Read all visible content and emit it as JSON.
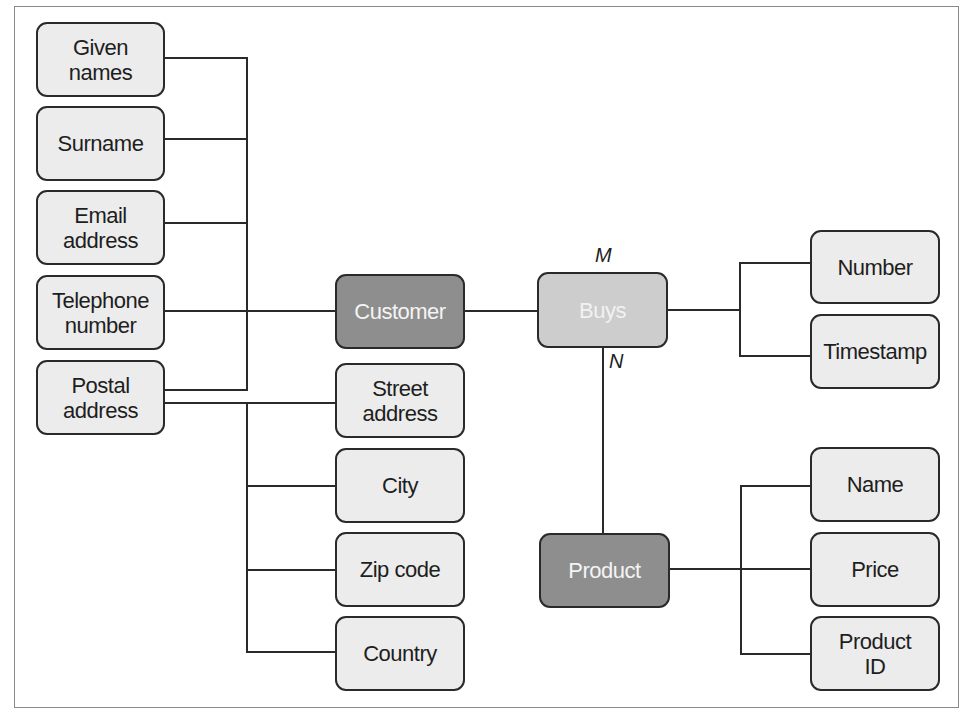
{
  "diagram": {
    "type": "entity-relationship",
    "entities": [
      {
        "id": "customer",
        "label": "Customer"
      },
      {
        "id": "product",
        "label": "Product"
      }
    ],
    "relationships": [
      {
        "id": "buys",
        "label": "Buys",
        "from": "customer",
        "to": "product",
        "cardinality_from": "M",
        "cardinality_to": "N"
      }
    ],
    "attributes": {
      "customer": [
        {
          "id": "given-names",
          "label": "Given\nnames"
        },
        {
          "id": "surname",
          "label": "Surname"
        },
        {
          "id": "email-address",
          "label": "Email\naddress"
        },
        {
          "id": "telephone-number",
          "label": "Telephone\nnumber"
        },
        {
          "id": "postal-address",
          "label": "Postal\naddress"
        }
      ],
      "postal_address": [
        {
          "id": "street-address",
          "label": "Street\naddress"
        },
        {
          "id": "city",
          "label": "City"
        },
        {
          "id": "zip-code",
          "label": "Zip code"
        },
        {
          "id": "country",
          "label": "Country"
        }
      ],
      "buys": [
        {
          "id": "number",
          "label": "Number"
        },
        {
          "id": "timestamp",
          "label": "Timestamp"
        }
      ],
      "product": [
        {
          "id": "name",
          "label": "Name"
        },
        {
          "id": "price",
          "label": "Price"
        },
        {
          "id": "product-id",
          "label": "Product\nID"
        }
      ]
    },
    "cardinality": {
      "m": "M",
      "n": "N"
    },
    "colors": {
      "entity_fill": "#8e8e8e",
      "relation_fill": "#cdcdcd",
      "attribute_fill": "#ececec",
      "stroke": "#2a2a2a"
    }
  }
}
